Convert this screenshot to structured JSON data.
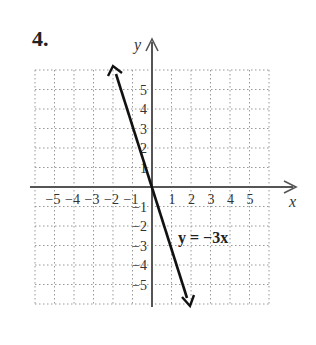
{
  "problem": {
    "number": "4."
  },
  "chart_data": {
    "type": "line",
    "title": "",
    "xlabel": "x",
    "ylabel": "y",
    "xlim": [
      -6,
      6
    ],
    "ylim": [
      -6,
      6
    ],
    "grid": true,
    "grid_style": "dotted",
    "x_tick_labels": [
      "-5",
      "-4",
      "-3",
      "-2",
      "-1",
      "1",
      "2",
      "3",
      "4",
      "5"
    ],
    "y_tick_labels": [
      "5",
      "4",
      "3",
      "2",
      "1",
      "-1",
      "-2",
      "-3",
      "-4",
      "-5"
    ],
    "series": [
      {
        "name": "y = -3x",
        "equation": "y = −3x",
        "x": [
          -2,
          -1,
          0,
          1,
          2
        ],
        "y": [
          6,
          3,
          0,
          -3,
          -6
        ],
        "arrows": "both"
      }
    ],
    "annotations": [
      {
        "text": "y = −3x",
        "x": 1.4,
        "y": -2.6
      }
    ]
  },
  "labels": {
    "x_axis": "x",
    "y_axis": "y",
    "equation": "y = −3x",
    "x_ticks": [
      "−5",
      "−4",
      "−3",
      "−2",
      "−1",
      "1",
      "2",
      "3",
      "4",
      "5"
    ],
    "y_ticks_pos": [
      "5",
      "4",
      "3",
      "2",
      "1"
    ],
    "y_ticks_neg": [
      "−1",
      "−2",
      "−3",
      "−4",
      "−5"
    ]
  }
}
